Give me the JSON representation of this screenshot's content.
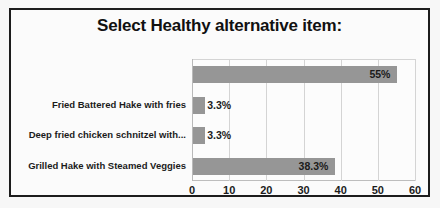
{
  "artifact": {
    "ghost_text": "Does your menu offer any Healthy Choices?"
  },
  "colors": {
    "bar_fill": "#969696",
    "frame_border": "#1c1c1c",
    "gridline": "#d4d4d4",
    "text": "#1b1b1b",
    "plot_background": "#fcfcfc"
  },
  "chart_data": {
    "type": "bar",
    "orientation": "horizontal",
    "title": "Select Healthy alternative item:",
    "xlabel": "",
    "ylabel": "",
    "xlim": [
      0,
      60
    ],
    "grid": true,
    "legend": false,
    "legend_position": "none",
    "xticks": [
      0,
      10,
      20,
      30,
      40,
      50,
      60
    ],
    "xtick_labels": [
      "0",
      "10",
      "20",
      "30",
      "40",
      "50",
      "60"
    ],
    "categories": [
      "",
      "Fried Battered Hake with fries",
      "Deep fried chicken schnitzel with...",
      "Grilled Hake with Steamed Veggies"
    ],
    "values": [
      55,
      3.3,
      3.3,
      38.3
    ],
    "data_labels": [
      "55%",
      "3.3%",
      "3.3%",
      "38.3%"
    ],
    "data_label_position": [
      "inside-end",
      "outside-end",
      "outside-end",
      "inside-end"
    ],
    "bars": [
      {
        "category": "",
        "value": 55,
        "label": "55%"
      },
      {
        "category": "Fried Battered Hake with fries",
        "value": 3.3,
        "label": "3.3%"
      },
      {
        "category": "Deep fried chicken schnitzel with...",
        "value": 3.3,
        "label": "3.3%"
      },
      {
        "category": "Grilled Hake with Steamed Veggies",
        "value": 38.3,
        "label": "38.3%"
      }
    ]
  }
}
